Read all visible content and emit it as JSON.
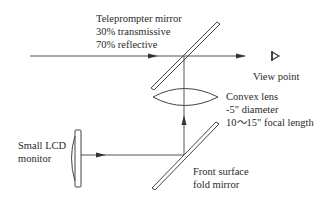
{
  "labels": {
    "teleprompter_mirror": {
      "line1": "Teleprompter mirror",
      "line2": "30% transmissive",
      "line3": "70% reflective"
    },
    "view_point": "View point",
    "convex_lens": {
      "line1": "Convex lens",
      "line2": "-5\" diameter",
      "line3": "10～15\" focal length"
    },
    "lcd_monitor": {
      "line1": "Small LCD",
      "line2": "monitor"
    },
    "fold_mirror": {
      "line1": "Front surface",
      "line2": "fold mirror"
    }
  },
  "icons": {
    "eye": "eye-icon",
    "arrow": "arrowhead"
  },
  "colors": {
    "line": "#444444",
    "text": "#2a2a2a",
    "background": "#ffffff"
  }
}
